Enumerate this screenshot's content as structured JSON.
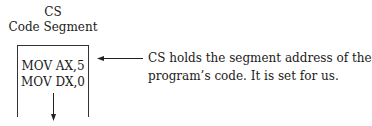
{
  "diagram": {
    "register_name": "CS",
    "segment_label": "Code Segment",
    "code_lines": [
      "MOV AX,5",
      "MOV DX,0"
    ],
    "annotation_lines": [
      "CS holds the segment address of the",
      "program’s code. It is set for us."
    ],
    "arrows": [
      {
        "name": "pointer-arrow",
        "direction": "left",
        "from": "annotation",
        "to": "code-segment-top"
      },
      {
        "name": "execution-arrow",
        "direction": "down",
        "meaning": "instruction flow"
      }
    ]
  }
}
